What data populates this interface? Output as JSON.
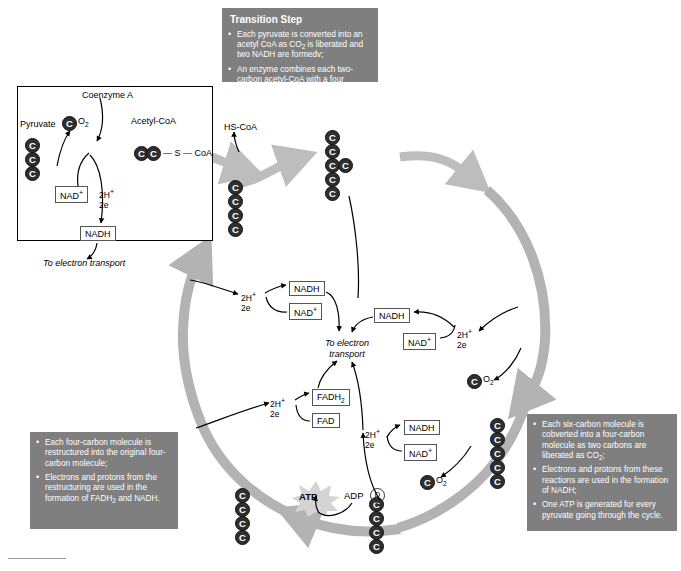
{
  "transition_box": {
    "title": "Transition Step",
    "bullets": [
      "Each pyruvate is converted into an acetyl CoA as CO2 is liberated and two NADH are formedv;",
      "An enzyme combines each two-carbon acetyl-CoA with a four carbon molecule to form a six carbon molecule."
    ]
  },
  "right_box": {
    "bullets": [
      "Each six-carbon molecule is cobverted into a four-carbon molecule as two carbons are liberated as CO2;",
      "Electrons and protons from these reactions are used in the formation of NADH;",
      "One ATP is generated for every pyruvate going through the cycle."
    ]
  },
  "left_box": {
    "bullets": [
      "Each four-carbon molecule is restructured into the original four-carbon molecule;",
      "Electrons and protons from the restructuring are used in the formation of FADH2 and NADH."
    ]
  },
  "pyruvate_panel": {
    "pyruvate_label": "Pyruvate",
    "coenzyme_label": "Coenzyme A",
    "acetyl_label": "Acetyl-CoA",
    "co2_c": "C",
    "co2_o": "O",
    "co2_sub": "2",
    "nad_plus": "NAD",
    "nad_plus_sup": "+",
    "nadh": "NADH",
    "h_line1": "2H",
    "h_line1_sup": "+",
    "h_line2": "2e",
    "acetyl_bond": "— S — CoA",
    "to_electron_transport": "To electron transport",
    "carbon_letter": "C",
    "pyruvate_carbons": 3,
    "acetyl_carbons": 2
  },
  "cycle": {
    "hs_coa": "HS-CoA",
    "center_label_line1": "To electron",
    "center_label_line2": "transport",
    "atp": "ATP",
    "adp": "ADP",
    "phosphate": "D",
    "carbon_letter": "C",
    "co2_c": "C",
    "co2_o": "O",
    "co2_sub": "2"
  },
  "molecules": {
    "nadh": "NADH",
    "nad": "NAD",
    "nad_sup": "+",
    "fadh2_text": "FADH",
    "fadh2_sub": "2",
    "fad": "FAD",
    "h_plus": "2H",
    "h_plus_sup": "+",
    "two_e": "2e"
  },
  "carbon_chains": {
    "four_carbon_top_left": 4,
    "six_carbon_top": 5,
    "six_carbon_side": 1,
    "five_carbon_right": 5,
    "four_carbon_bottom_right": 4,
    "four_carbon_bottom_left": 4
  },
  "colors": {
    "infobox_bg": "#7f7f7f",
    "infobox_text": "#ffffff",
    "carbon_fill": "#2f2f2f",
    "thick_arrow": "#bdbdbd",
    "thin_arrow": "#000000",
    "page_bg": "#ffffff"
  }
}
